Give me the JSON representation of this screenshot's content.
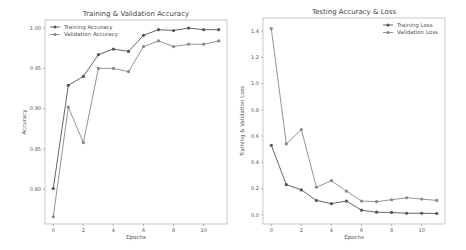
{
  "chart_data": [
    {
      "type": "line",
      "title": "Training & Validation Accuracy",
      "xlabel": "Epochs",
      "ylabel": "Accuracy",
      "x": [
        0,
        1,
        2,
        3,
        4,
        5,
        6,
        7,
        8,
        9,
        10,
        11
      ],
      "xticks": [
        0,
        2,
        4,
        6,
        8,
        10
      ],
      "yticks": [
        0.8,
        0.85,
        0.9,
        0.95,
        1.0
      ],
      "ytick_labels": [
        "0.80",
        "0.85",
        "0.90",
        "0.95",
        "1.00"
      ],
      "ylim": [
        0.757,
        1.01
      ],
      "xlim": [
        -0.55,
        11.55
      ],
      "grid": false,
      "legend_position": "upper left",
      "series": [
        {
          "name": "Training Accuracy",
          "color": "#555555",
          "values": [
            0.801,
            0.929,
            0.94,
            0.967,
            0.974,
            0.971,
            0.991,
            0.998,
            0.997,
            1.0,
            0.998,
            0.998
          ]
        },
        {
          "name": "Validation Accuracy",
          "color": "#888888",
          "values": [
            0.766,
            0.902,
            0.858,
            0.95,
            0.95,
            0.946,
            0.977,
            0.984,
            0.977,
            0.98,
            0.98,
            0.984
          ]
        }
      ]
    },
    {
      "type": "line",
      "title": "Testing Accuracy & Loss",
      "xlabel": "Epochs",
      "ylabel": "Training & Validation Loss",
      "x": [
        0,
        1,
        2,
        3,
        4,
        5,
        6,
        7,
        8,
        9,
        10,
        11
      ],
      "xticks": [
        0,
        2,
        4,
        6,
        8,
        10
      ],
      "yticks": [
        0.0,
        0.2,
        0.4,
        0.6,
        0.8,
        1.0,
        1.2,
        1.4
      ],
      "ytick_labels": [
        "0.0",
        "0.2",
        "0.4",
        "0.6",
        "0.8",
        "1.0",
        "1.2",
        "1.4"
      ],
      "ylim": [
        -0.07,
        1.5
      ],
      "xlim": [
        -0.55,
        11.55
      ],
      "grid": false,
      "legend_position": "upper right",
      "series": [
        {
          "name": "Training Loss",
          "color": "#555555",
          "values": [
            0.53,
            0.23,
            0.19,
            0.11,
            0.085,
            0.105,
            0.035,
            0.02,
            0.018,
            0.012,
            0.012,
            0.01
          ]
        },
        {
          "name": "Validation Loss",
          "color": "#888888",
          "values": [
            1.42,
            0.54,
            0.65,
            0.21,
            0.26,
            0.18,
            0.105,
            0.1,
            0.115,
            0.13,
            0.12,
            0.11
          ]
        }
      ]
    }
  ],
  "layout": {
    "plots": [
      {
        "left": 45,
        "top": 20,
        "right": 227,
        "bottom": 224
      },
      {
        "left": 263,
        "top": 18,
        "right": 445,
        "bottom": 224
      }
    ]
  }
}
